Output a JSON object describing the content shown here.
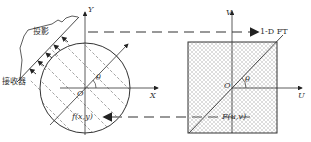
{
  "diagram": {
    "left": {
      "axis_x": "X",
      "axis_y": "Y",
      "origin": "O",
      "angle": "θ",
      "function": "f(x,y)",
      "projection": "投影",
      "detector": "接收器"
    },
    "right": {
      "axis_u": "U",
      "axis_v": "V",
      "origin": "O",
      "angle": "θ",
      "function": "F(u,v)"
    },
    "arrows": {
      "top": "1-D FT"
    }
  }
}
